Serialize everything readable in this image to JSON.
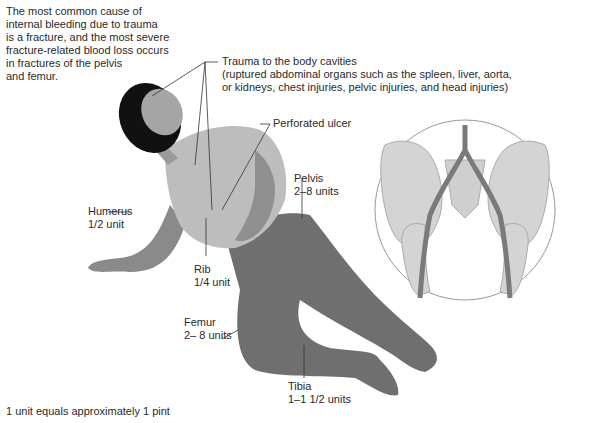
{
  "intro": {
    "lines": [
      "The most common cause of",
      "internal bleeding due to trauma",
      "is a fracture, and the most severe",
      "fracture-related blood loss occurs",
      "in fractures of the pelvis",
      "and femur."
    ]
  },
  "labels": {
    "trauma": {
      "title": "Trauma to the body cavities",
      "detail_1": "(ruptured abdominal organs such as the spleen, liver, aorta,",
      "detail_2": "or kidneys, chest injuries, pelvic injuries, and head injuries)"
    },
    "ulcer": {
      "title": "Perforated ulcer"
    },
    "pelvis": {
      "title": "Pelvis",
      "amount": "2–8 units"
    },
    "humerus": {
      "title": "Humerus",
      "amount": "1/2 unit"
    },
    "rib": {
      "title": "Rib",
      "amount": "1/4 unit"
    },
    "femur": {
      "title": "Femur",
      "amount": "2– 8 units"
    },
    "tibia": {
      "title": "Tibia",
      "amount": "1–1 1/2 units"
    }
  },
  "footnote": "1 unit equals approximately 1 pint",
  "colors": {
    "hair": "#111111",
    "skin": "#9a9a9a",
    "shirt": "#bdbdbd",
    "pants": "#6f6f6f",
    "bone": "#d4d4d4",
    "vessel": "#7a7a7a",
    "leader": "#333333"
  }
}
